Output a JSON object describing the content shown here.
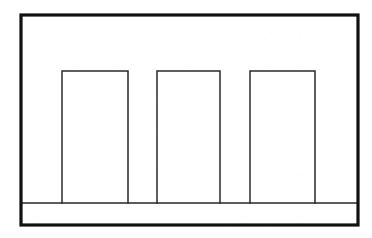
{
  "figure": {
    "kind": "line-drawing",
    "background_color": "#ffffff",
    "frame": {
      "name": "outer-frame",
      "stroke_color": "#111111",
      "stroke_width": 3.2,
      "x": 21,
      "y": 15,
      "width": 337,
      "height": 210
    },
    "baseline": {
      "name": "ground-line",
      "stroke_color": "#262626",
      "stroke_width": 1.7,
      "x1": 22,
      "y1": 203,
      "x2": 357,
      "y2": 203
    },
    "bars": [
      {
        "label": "bar-1",
        "stroke_color": "#2a2a2a",
        "stroke_width": 1.5,
        "x": 62,
        "y": 71,
        "width": 66,
        "height": 132,
        "open_bottom": true
      },
      {
        "label": "bar-2",
        "stroke_color": "#2a2a2a",
        "stroke_width": 1.5,
        "x": 157,
        "y": 71,
        "width": 63,
        "height": 132,
        "open_bottom": true
      },
      {
        "label": "bar-3",
        "stroke_color": "#2a2a2a",
        "stroke_width": 1.5,
        "x": 250,
        "y": 71,
        "width": 65,
        "height": 132,
        "open_bottom": true
      }
    ]
  }
}
